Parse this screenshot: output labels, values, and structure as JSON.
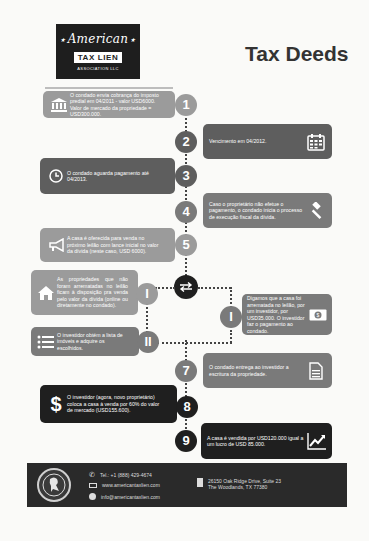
{
  "header": {
    "logo": {
      "line1": "American",
      "line2": "TAX LIEN",
      "line3": "ASSOCIATION LLC"
    },
    "title": "Tax Deeds"
  },
  "steps": [
    {
      "number": "1",
      "icon": "bank-icon",
      "text": "O condado envia cobrança do imposto predial em 04/2011 - valor USD6000. Valor de mercado da propriedade = USD300.000."
    },
    {
      "number": "2",
      "icon": "calendar-icon",
      "text": "Vencimento em 04/2012."
    },
    {
      "number": "3",
      "icon": "clock-icon",
      "text": "O condado aguarda pagamento até 04/2013."
    },
    {
      "number": "4",
      "icon": "gavel-icon",
      "text": "Caso o proprietário não efetue o pagamento, o condado inicia o processo de execução fiscal da dívida."
    },
    {
      "number": "5",
      "icon": "megaphone-icon",
      "text": "A casa é oferecida para venda no próximo leilão com lance inicial no valor da dívida (neste caso, USD 6000)."
    },
    {
      "number": "7",
      "icon": "document-icon",
      "text": "O condado entrega ao investidor a escritura da propriedade."
    },
    {
      "number": "8",
      "icon": "dollar-icon",
      "text": "O investidor (agora, novo proprietário) coloca a casa à venda por 60% do valor de mercado (USD155.600)."
    },
    {
      "number": "9",
      "icon": "chart-up-icon",
      "text": "A casa é vendida por USD120.000 igual a um lucro de USD 85.000."
    }
  ],
  "branches": {
    "switch_icon": "swap-arrows-icon",
    "left_I": {
      "label": "I",
      "icon": "house-icon",
      "text": "As propriedades que não foram arrematadas no leilão ficam à disposição pra venda pelo valor da dívida (online ou diretamente no condado)."
    },
    "left_II": {
      "label": "II",
      "icon": "list-icon",
      "text": "O investidor obtém a lista de imóveis e adquire os escolhidos."
    },
    "right_I": {
      "label": "I",
      "icon": "money-icon",
      "text": "Digamos que a casa foi arrematada no leilão, por um investidor, por USD35.000. O investidor faz o pagamento ao condado."
    }
  },
  "footer": {
    "phone": "Tel.: +1 (888) 429-4674",
    "website": "www.americantaxlien.com",
    "email": "info@americantaxlien.com",
    "address_line1": "26150 Oak Ridge Drive, Suite 23",
    "address_line2": "The Woodlands, TX 77380"
  },
  "colors": {
    "light": "#9b9b9b",
    "mid": "#7a7a7a",
    "dark": "#5e5e5e",
    "black": "#1f1f1f"
  }
}
